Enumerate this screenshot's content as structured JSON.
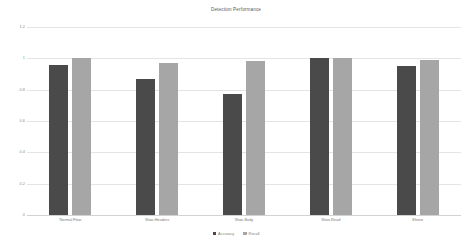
{
  "chart_data": {
    "type": "bar",
    "title": "Detection Performance",
    "xlabel": "",
    "ylabel": "",
    "ylim": [
      0,
      1.2
    ],
    "yticks": [
      "0",
      "0.2",
      "0.4",
      "0.6",
      "0.8",
      "1",
      "1.2"
    ],
    "grid": true,
    "legend_position": "bottom",
    "categories": [
      "Normal Flow",
      "Slow-Headers",
      "Slow-Body",
      "Slow-Read",
      "Shrew"
    ],
    "series": [
      {
        "name": "Accuracy",
        "color": "#4a4a4a",
        "values": [
          0.96,
          0.87,
          0.77,
          1.0,
          0.95
        ]
      },
      {
        "name": "Recall",
        "color": "#a6a6a6",
        "values": [
          1.0,
          0.97,
          0.98,
          1.0,
          0.99
        ]
      }
    ]
  }
}
